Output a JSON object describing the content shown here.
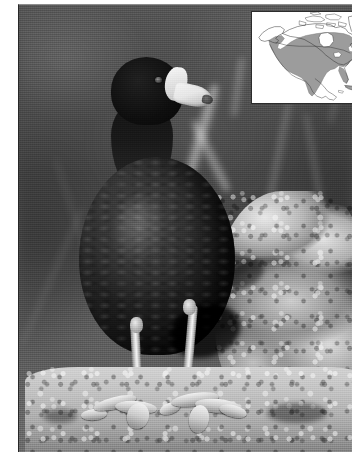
{
  "figure": {
    "subject": "American Coot",
    "medium": "black-and-white photograph",
    "orientation": "portrait",
    "caption": ""
  },
  "photo": {
    "background_description": "dark blurred water with out-of-focus pale reed stems",
    "foreground_description": "pale rough textured rock ledge",
    "bird": {
      "pose": "standing, facing viewer, head turned right",
      "body_label": "coot body",
      "head_label": "coot head",
      "bill_label": "white bill with dark tip",
      "shield_label": "white frontal shield",
      "eye_label": "eye",
      "leg_label": "leg",
      "foot_label": "lobed foot"
    },
    "tones": {
      "background_dark": "#4a4a4a",
      "bird_black": "#1d1d1d",
      "bill_white": "#eeeeee",
      "rock_light": "#c9c9c9",
      "frame_white": "#ffffff"
    }
  },
  "map_inset": {
    "title": "North America range map",
    "continent_label": "North America",
    "range_shading_label": "breeding and year-round range",
    "range_color": "#9b9b9b",
    "land_outline_color": "#3a3a3a",
    "map_background": "#ffffff",
    "border_color": "#2f2f2f",
    "regions_shaded": [
      "contiguous United States",
      "southern Canada",
      "Pacific coast of British Columbia",
      "Mexico",
      "Florida",
      "Caribbean islands"
    ],
    "regions_unshaded": [
      "Alaska interior",
      "northern Canada",
      "Canadian Arctic Archipelago",
      "Greenland"
    ]
  }
}
